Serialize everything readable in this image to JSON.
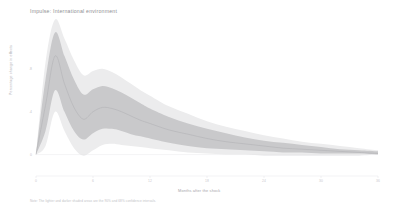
{
  "figure": {
    "title": "Impulse: International environment",
    "ylabel": "Percentage change in effects",
    "xlabel": "Months after the shock",
    "footnote": "Note: The lighter and darker shaded areas are the 90% and 68% confidence intervals.",
    "colors": {
      "background": "#ffffff",
      "band_90": "#ececed",
      "band_68": "#c9c9cb",
      "median_line": "#b0b0b3",
      "axis_text": "#b4b4b8",
      "title_text": "#8f8f93",
      "footnote_text": "#c2c2c6"
    }
  },
  "chart_data": {
    "type": "area",
    "title": "Impulse: International environment",
    "xlabel": "Months after the shock",
    "ylabel": "Percentage change in effects",
    "xlim": [
      0,
      36
    ],
    "ylim": [
      -0.2,
      1.2
    ],
    "grid": false,
    "legend": "none",
    "xticks": [
      0,
      6,
      12,
      18,
      24,
      30,
      36
    ],
    "xticklabels": [
      "0",
      "6",
      "12",
      "18",
      "24",
      "30",
      "36"
    ],
    "yticks": [
      0.0,
      0.4,
      0.8
    ],
    "yticklabels": [
      "0",
      ".4",
      ".8"
    ],
    "x": [
      0,
      1,
      2,
      3,
      4,
      5,
      6,
      7,
      8,
      9,
      10,
      11,
      12,
      14,
      16,
      18,
      20,
      22,
      24,
      26,
      28,
      30,
      32,
      34,
      36
    ],
    "series": [
      {
        "name": "median",
        "values": [
          0.0,
          0.46,
          0.92,
          0.66,
          0.44,
          0.33,
          0.4,
          0.44,
          0.43,
          0.4,
          0.36,
          0.32,
          0.29,
          0.23,
          0.19,
          0.15,
          0.12,
          0.1,
          0.08,
          0.06,
          0.05,
          0.04,
          0.03,
          0.02,
          0.01
        ]
      },
      {
        "name": "ci68_lower",
        "values": [
          0.0,
          0.22,
          0.6,
          0.4,
          0.22,
          0.14,
          0.2,
          0.24,
          0.24,
          0.22,
          0.19,
          0.17,
          0.15,
          0.11,
          0.08,
          0.06,
          0.05,
          0.04,
          0.03,
          0.02,
          0.02,
          0.01,
          0.01,
          0.01,
          0.0
        ]
      },
      {
        "name": "ci68_upper",
        "values": [
          0.0,
          0.7,
          1.14,
          0.92,
          0.7,
          0.56,
          0.61,
          0.64,
          0.62,
          0.58,
          0.53,
          0.48,
          0.43,
          0.35,
          0.29,
          0.24,
          0.2,
          0.16,
          0.13,
          0.11,
          0.09,
          0.07,
          0.05,
          0.04,
          0.03
        ]
      },
      {
        "name": "ci90_lower",
        "values": [
          0.0,
          0.08,
          0.4,
          0.22,
          0.06,
          -0.01,
          0.04,
          0.09,
          0.1,
          0.09,
          0.08,
          0.07,
          0.06,
          0.04,
          0.02,
          0.01,
          0.0,
          0.0,
          -0.01,
          -0.01,
          -0.01,
          -0.01,
          -0.01,
          -0.01,
          0.0
        ]
      },
      {
        "name": "ci90_upper",
        "values": [
          0.0,
          0.86,
          1.26,
          1.08,
          0.88,
          0.74,
          0.78,
          0.8,
          0.77,
          0.72,
          0.66,
          0.6,
          0.55,
          0.45,
          0.38,
          0.31,
          0.26,
          0.22,
          0.18,
          0.15,
          0.12,
          0.1,
          0.08,
          0.06,
          0.04
        ]
      }
    ]
  }
}
